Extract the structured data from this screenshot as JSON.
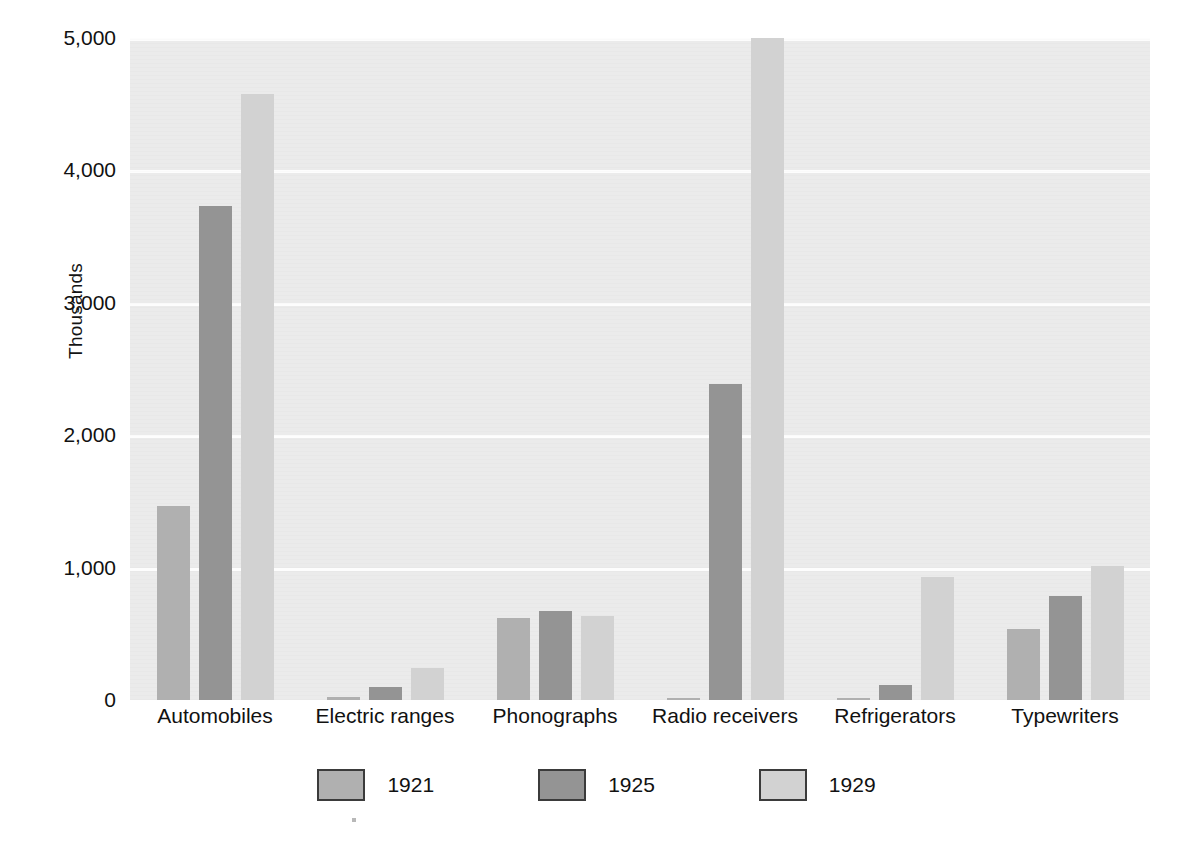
{
  "chart_data": {
    "type": "bar",
    "title": "",
    "subtitle": "",
    "xlabel": "",
    "ylabel": "Thousands",
    "ylim": [
      0,
      5000
    ],
    "ytick_values": [
      0,
      1000,
      2000,
      3000,
      4000,
      5000
    ],
    "ytick_labels": [
      "0",
      "1,000",
      "2,000",
      "3,000",
      "4,000",
      "5,000"
    ],
    "grid": true,
    "legend_position": "bottom",
    "categories": [
      "Automobiles",
      "Electric ranges",
      "Phonographs",
      "Radio receivers",
      "Refrigerators",
      "Typewriters"
    ],
    "series": [
      {
        "name": "1921",
        "color": "#b0b0b0",
        "values": [
          1468,
          26,
          616,
          5,
          10,
          540
        ]
      },
      {
        "name": "1925",
        "color": "#949494",
        "values": [
          3735,
          100,
          670,
          2390,
          110,
          785
        ]
      },
      {
        "name": "1929",
        "color": "#d2d2d2",
        "values": [
          4575,
          240,
          632,
          5000,
          930,
          1010
        ]
      }
    ]
  },
  "axes": {
    "y_title": "Thousands"
  },
  "legend": {
    "entries": [
      {
        "label": "1921",
        "color": "#b0b0b0"
      },
      {
        "label": "1925",
        "color": "#949494"
      },
      {
        "label": "1929",
        "color": "#d2d2d2"
      }
    ]
  },
  "colors": {
    "plot_background": "#ebebeb",
    "gridline": "#fdfdfd",
    "page_background": "#ffffff",
    "text": "#111111",
    "legend_swatch_border": "#3b3b3b"
  }
}
